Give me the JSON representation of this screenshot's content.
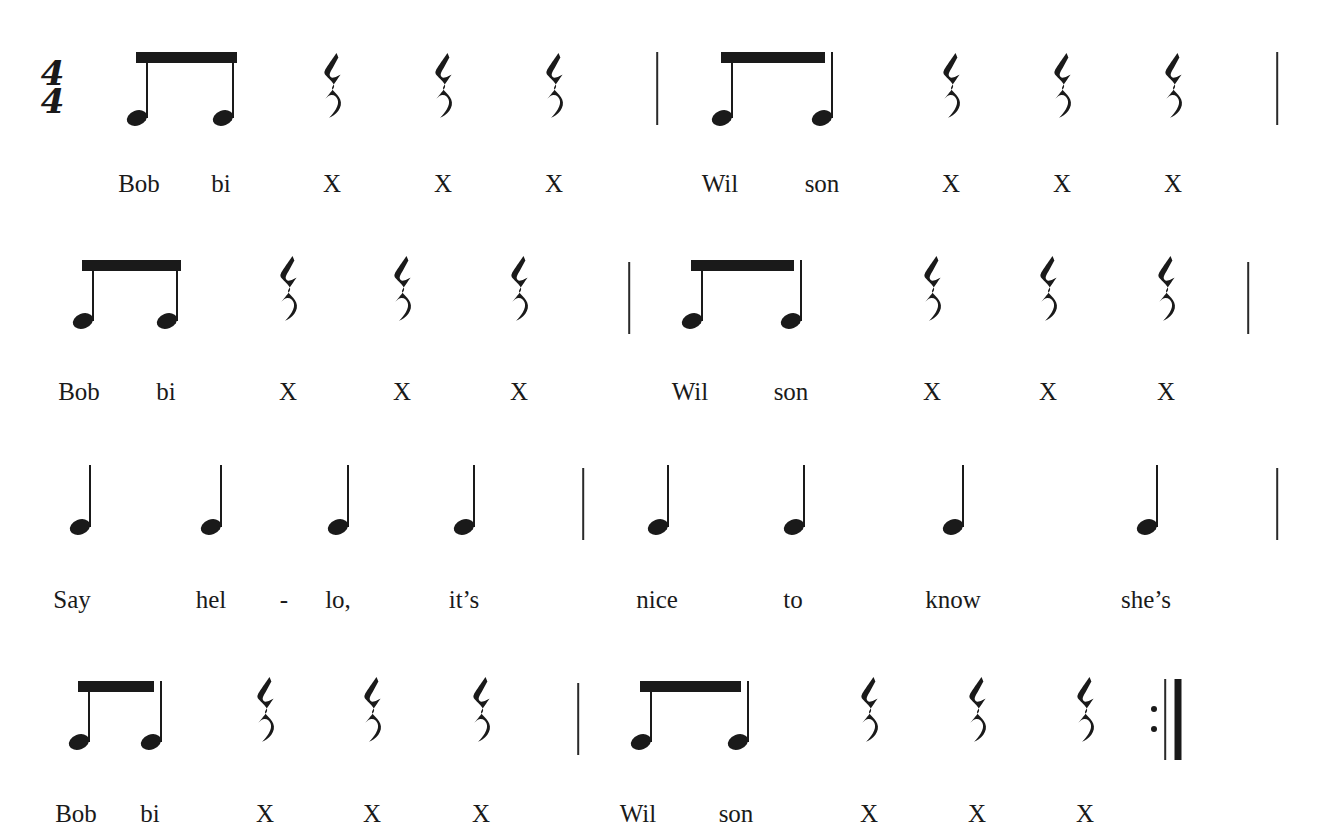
{
  "document": {
    "kind": "music-notation-excerpt",
    "time_signature": {
      "numerator": "4",
      "denominator": "4"
    },
    "symbols": {
      "quarter_rest": "quarter-rest",
      "eighth_note": "eighth-note",
      "quarter_note": "quarter-note",
      "beam": "beam",
      "barline": "barline",
      "end_repeat_barline": "end-repeat-barline"
    },
    "colors": {
      "ink": "#1a1a1a",
      "paper": "#ffffff",
      "barline": "#2a2a2a"
    }
  },
  "systems": [
    {
      "id": "system-1",
      "measures": [
        {
          "id": "m1",
          "events": [
            {
              "type": "eighth-note",
              "lyric": "Bob"
            },
            {
              "type": "eighth-note",
              "lyric": "bi"
            },
            {
              "type": "quarter-rest",
              "lyric": "X"
            },
            {
              "type": "quarter-rest",
              "lyric": "X"
            },
            {
              "type": "quarter-rest",
              "lyric": "X"
            }
          ]
        },
        {
          "id": "m2",
          "events": [
            {
              "type": "eighth-note",
              "lyric": "Wil"
            },
            {
              "type": "eighth-note",
              "lyric": "son"
            },
            {
              "type": "quarter-rest",
              "lyric": "X"
            },
            {
              "type": "quarter-rest",
              "lyric": "X"
            },
            {
              "type": "quarter-rest",
              "lyric": "X"
            }
          ]
        }
      ]
    },
    {
      "id": "system-2",
      "measures": [
        {
          "id": "m3",
          "events": [
            {
              "type": "eighth-note",
              "lyric": "Bob"
            },
            {
              "type": "eighth-note",
              "lyric": "bi"
            },
            {
              "type": "quarter-rest",
              "lyric": "X"
            },
            {
              "type": "quarter-rest",
              "lyric": "X"
            },
            {
              "type": "quarter-rest",
              "lyric": "X"
            }
          ]
        },
        {
          "id": "m4",
          "events": [
            {
              "type": "eighth-note",
              "lyric": "Wil"
            },
            {
              "type": "eighth-note",
              "lyric": "son"
            },
            {
              "type": "quarter-rest",
              "lyric": "X"
            },
            {
              "type": "quarter-rest",
              "lyric": "X"
            },
            {
              "type": "quarter-rest",
              "lyric": "X"
            }
          ]
        }
      ]
    },
    {
      "id": "system-3",
      "measures": [
        {
          "id": "m5",
          "events": [
            {
              "type": "quarter-note",
              "lyric": "Say"
            },
            {
              "type": "quarter-note",
              "lyric": "hel"
            },
            {
              "type": "quarter-note",
              "lyric": "lo,"
            },
            {
              "type": "quarter-note",
              "lyric": "it’s"
            }
          ]
        },
        {
          "id": "m6",
          "events": [
            {
              "type": "quarter-note",
              "lyric": "nice"
            },
            {
              "type": "quarter-note",
              "lyric": "to"
            },
            {
              "type": "quarter-note",
              "lyric": "know"
            },
            {
              "type": "quarter-note",
              "lyric": "she’s"
            }
          ]
        }
      ],
      "hyphen": "-"
    },
    {
      "id": "system-4",
      "measures": [
        {
          "id": "m7",
          "events": [
            {
              "type": "eighth-note",
              "lyric": "Bob"
            },
            {
              "type": "eighth-note",
              "lyric": "bi"
            },
            {
              "type": "quarter-rest",
              "lyric": "X"
            },
            {
              "type": "quarter-rest",
              "lyric": "X"
            },
            {
              "type": "quarter-rest",
              "lyric": "X"
            }
          ]
        },
        {
          "id": "m8",
          "events": [
            {
              "type": "eighth-note",
              "lyric": "Wil"
            },
            {
              "type": "eighth-note",
              "lyric": "son"
            },
            {
              "type": "quarter-rest",
              "lyric": "X"
            },
            {
              "type": "quarter-rest",
              "lyric": "X"
            },
            {
              "type": "quarter-rest",
              "lyric": "X"
            }
          ]
        }
      ],
      "ending": "end-repeat-barline"
    }
  ],
  "lyrics_flat": {
    "system_1": [
      "Bob",
      "bi",
      "X",
      "X",
      "X",
      "Wil",
      "son",
      "X",
      "X",
      "X"
    ],
    "system_2": [
      "Bob",
      "bi",
      "X",
      "X",
      "X",
      "Wil",
      "son",
      "X",
      "X",
      "X"
    ],
    "system_3": [
      "Say",
      "hel",
      "-",
      "lo,",
      "it’s",
      "nice",
      "to",
      "know",
      "she’s"
    ],
    "system_4": [
      "Bob",
      "bi",
      "X",
      "X",
      "X",
      "Wil",
      "son",
      "X",
      "X",
      "X"
    ]
  },
  "layout": {
    "systems": [
      {
        "id": "system-1",
        "top": 0,
        "timesig_x": 52,
        "timesig_y": 88,
        "note_baseline": 118,
        "stem_top": 52,
        "lyric_y": 170,
        "barlines": [
          657,
          1277
        ],
        "barline_top": 52,
        "barline_bottom": 125,
        "beams": [
          {
            "x1": 137,
            "x2": 236,
            "y": 52
          },
          {
            "x1": 722,
            "x2": 824,
            "y": 52
          }
        ],
        "items": [
          {
            "type": "eighth-note",
            "x": 137,
            "lyric": "Bob",
            "lyric_x": 139
          },
          {
            "type": "eighth-note",
            "x": 223,
            "lyric": "bi",
            "lyric_x": 221
          },
          {
            "type": "quarter-rest",
            "x": 332,
            "lyric": "X",
            "lyric_x": 332
          },
          {
            "type": "quarter-rest",
            "x": 443,
            "lyric": "X",
            "lyric_x": 443
          },
          {
            "type": "quarter-rest",
            "x": 554,
            "lyric": "X",
            "lyric_x": 554
          },
          {
            "type": "eighth-note",
            "x": 722,
            "lyric": "Wil",
            "lyric_x": 720
          },
          {
            "type": "eighth-note",
            "x": 822,
            "lyric": "son",
            "lyric_x": 822
          },
          {
            "type": "quarter-rest",
            "x": 951,
            "lyric": "X",
            "lyric_x": 951
          },
          {
            "type": "quarter-rest",
            "x": 1062,
            "lyric": "X",
            "lyric_x": 1062
          },
          {
            "type": "quarter-rest",
            "x": 1173,
            "lyric": "X",
            "lyric_x": 1173
          }
        ]
      },
      {
        "id": "system-2",
        "top": 0,
        "note_baseline": 321,
        "stem_top": 260,
        "lyric_y": 378,
        "barlines": [
          629,
          1248
        ],
        "barline_top": 262,
        "barline_bottom": 334,
        "beams": [
          {
            "x1": 83,
            "x2": 180,
            "y": 260
          },
          {
            "x1": 692,
            "x2": 793,
            "y": 260
          }
        ],
        "items": [
          {
            "type": "eighth-note",
            "x": 83,
            "lyric": "Bob",
            "lyric_x": 79
          },
          {
            "type": "eighth-note",
            "x": 167,
            "lyric": "bi",
            "lyric_x": 166
          },
          {
            "type": "quarter-rest",
            "x": 288,
            "lyric": "X",
            "lyric_x": 288
          },
          {
            "type": "quarter-rest",
            "x": 402,
            "lyric": "X",
            "lyric_x": 402
          },
          {
            "type": "quarter-rest",
            "x": 519,
            "lyric": "X",
            "lyric_x": 519
          },
          {
            "type": "eighth-note",
            "x": 692,
            "lyric": "Wil",
            "lyric_x": 690
          },
          {
            "type": "eighth-note",
            "x": 791,
            "lyric": "son",
            "lyric_x": 791
          },
          {
            "type": "quarter-rest",
            "x": 932,
            "lyric": "X",
            "lyric_x": 932
          },
          {
            "type": "quarter-rest",
            "x": 1048,
            "lyric": "X",
            "lyric_x": 1048
          },
          {
            "type": "quarter-rest",
            "x": 1166,
            "lyric": "X",
            "lyric_x": 1166
          }
        ]
      },
      {
        "id": "system-3",
        "top": 0,
        "note_baseline": 527,
        "stem_top": 465,
        "lyric_y": 586,
        "barlines": [
          583,
          1277
        ],
        "barline_top": 468,
        "barline_bottom": 540,
        "beams": [],
        "hyphen_x": 284,
        "items": [
          {
            "type": "quarter-note",
            "x": 80,
            "lyric": "Say",
            "lyric_x": 72
          },
          {
            "type": "quarter-note",
            "x": 211,
            "lyric": "hel",
            "lyric_x": 211
          },
          {
            "type": "quarter-note",
            "x": 338,
            "lyric": "lo,",
            "lyric_x": 338
          },
          {
            "type": "quarter-note",
            "x": 464,
            "lyric": "it’s",
            "lyric_x": 464
          },
          {
            "type": "quarter-note",
            "x": 658,
            "lyric": "nice",
            "lyric_x": 657
          },
          {
            "type": "quarter-note",
            "x": 794,
            "lyric": "to",
            "lyric_x": 793
          },
          {
            "type": "quarter-note",
            "x": 953,
            "lyric": "know",
            "lyric_x": 953
          },
          {
            "type": "quarter-note",
            "x": 1147,
            "lyric": "she’s",
            "lyric_x": 1146
          }
        ]
      },
      {
        "id": "system-4",
        "top": 0,
        "note_baseline": 742,
        "stem_top": 681,
        "lyric_y": 800,
        "barlines": [
          578
        ],
        "barline_top": 683,
        "barline_bottom": 755,
        "repeat": {
          "thin_x": 1165,
          "thick_x": 1178,
          "top": 679,
          "bottom": 760,
          "dot_x": 1154,
          "dot_y1": 709,
          "dot_y2": 729
        },
        "beams": [
          {
            "x1": 79,
            "x2": 153,
            "y": 681
          },
          {
            "x1": 641,
            "x2": 740,
            "y": 681
          }
        ],
        "items": [
          {
            "type": "eighth-note",
            "x": 79,
            "lyric": "Bob",
            "lyric_x": 76
          },
          {
            "type": "eighth-note",
            "x": 151,
            "lyric": "bi",
            "lyric_x": 150
          },
          {
            "type": "quarter-rest",
            "x": 265,
            "lyric": "X",
            "lyric_x": 265
          },
          {
            "type": "quarter-rest",
            "x": 372,
            "lyric": "X",
            "lyric_x": 372
          },
          {
            "type": "quarter-rest",
            "x": 481,
            "lyric": "X",
            "lyric_x": 481
          },
          {
            "type": "eighth-note",
            "x": 641,
            "lyric": "Wil",
            "lyric_x": 638
          },
          {
            "type": "eighth-note",
            "x": 738,
            "lyric": "son",
            "lyric_x": 736
          },
          {
            "type": "quarter-rest",
            "x": 869,
            "lyric": "X",
            "lyric_x": 869
          },
          {
            "type": "quarter-rest",
            "x": 977,
            "lyric": "X",
            "lyric_x": 977
          },
          {
            "type": "quarter-rest",
            "x": 1085,
            "lyric": "X",
            "lyric_x": 1085
          }
        ]
      }
    ]
  }
}
